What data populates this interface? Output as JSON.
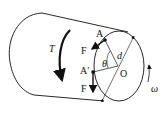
{
  "diagram": {
    "type": "physics-cylinder-torsion",
    "labels": {
      "torque": "T",
      "force_top": "F",
      "force_bottom": "F",
      "point_a": "A",
      "point_a_prime": "A′",
      "angle": "θ",
      "diameter": "d",
      "center": "O",
      "angular_velocity": "ω"
    },
    "colors": {
      "stroke": "#111111",
      "background": "#ffffff"
    }
  }
}
